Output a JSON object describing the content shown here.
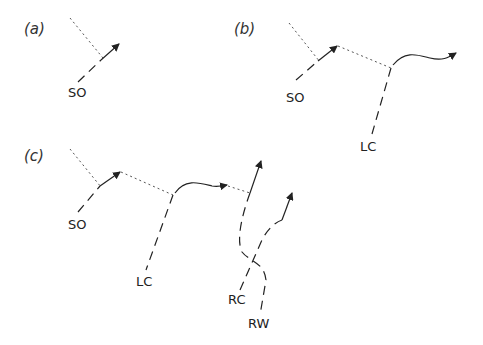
{
  "panels": [
    {
      "id": "a",
      "label": "(a)",
      "tracks": [
        {
          "label": "SO"
        }
      ]
    },
    {
      "id": "b",
      "label": "(b)",
      "tracks": [
        {
          "label": "SO"
        },
        {
          "label": "LC"
        }
      ]
    },
    {
      "id": "c",
      "label": "(c)",
      "tracks": [
        {
          "label": "SO"
        },
        {
          "label": "LC"
        },
        {
          "label": "RC"
        },
        {
          "label": "RW"
        }
      ]
    }
  ],
  "colors": {
    "ink": "#222222",
    "dotted": "#555555",
    "background": "#ffffff"
  }
}
